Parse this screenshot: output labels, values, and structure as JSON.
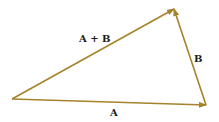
{
  "diagram": {
    "type": "vector-addition-triangle",
    "color": "#a5832a",
    "vectors": [
      {
        "name": "A",
        "label": "A",
        "from": [
          12,
          99
        ],
        "to": [
          206,
          105
        ]
      },
      {
        "name": "B",
        "label": "B",
        "from": [
          206,
          105
        ],
        "to": [
          174,
          9
        ]
      },
      {
        "name": "A+B",
        "label": "A + B",
        "from": [
          12,
          99
        ],
        "to": [
          174,
          9
        ]
      }
    ],
    "labels": {
      "a": "A",
      "b": "B",
      "sum": "A + B"
    }
  }
}
